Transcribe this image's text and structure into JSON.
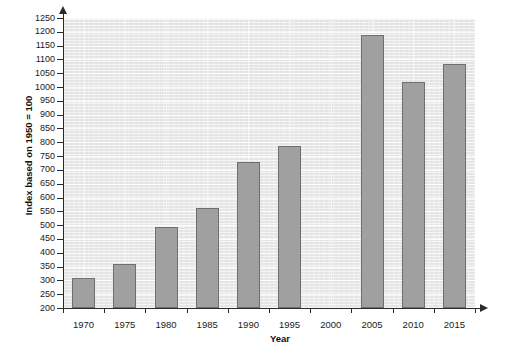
{
  "chart_data": {
    "type": "bar",
    "title": "",
    "xlabel": "Year",
    "ylabel": "Index based on 1950 = 100",
    "categories": [
      "1970",
      "1975",
      "1980",
      "1985",
      "1990",
      "1995",
      "2000",
      "2005",
      "2010",
      "2015"
    ],
    "values": [
      310,
      358,
      492,
      562,
      730,
      785,
      null,
      1188,
      1020,
      1085
    ],
    "ylim": [
      200,
      1250
    ],
    "ytick_step": 50,
    "ytick_labels": [
      "1250",
      "1200",
      "1150",
      "1100",
      "1050",
      "1000",
      "950",
      "900",
      "850",
      "800",
      "750",
      "700",
      "650",
      "600",
      "550",
      "500",
      "450",
      "400",
      "350",
      "300",
      "250",
      "200"
    ],
    "grid": true,
    "legend": false,
    "legend_position": "none",
    "bar_color": "#a0a0a0",
    "bar_border_color": "#6f6f6f",
    "plot_background_color": "#e9e9e9",
    "axis_color": "#2b2b2b",
    "missing_categories": [
      "2000"
    ]
  }
}
